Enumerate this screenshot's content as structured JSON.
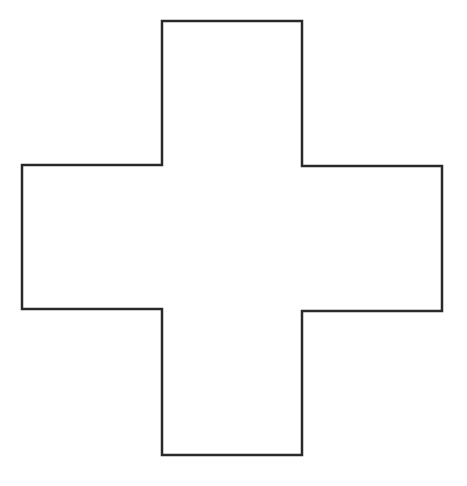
{
  "diagram": {
    "shape": "cross",
    "description": "Outlined Greek cross (plus sign) shape",
    "stroke_color": "#2a2a2a",
    "fill_color": "#ffffff",
    "background_color": "#ffffff",
    "stroke_width": 2.5,
    "points": [
      [
        162,
        21
      ],
      [
        302,
        21
      ],
      [
        302,
        166
      ],
      [
        442,
        166
      ],
      [
        442,
        311
      ],
      [
        302,
        311
      ],
      [
        302,
        455
      ],
      [
        162,
        455
      ],
      [
        162,
        309
      ],
      [
        22,
        309
      ],
      [
        22,
        165
      ],
      [
        162,
        165
      ]
    ]
  }
}
